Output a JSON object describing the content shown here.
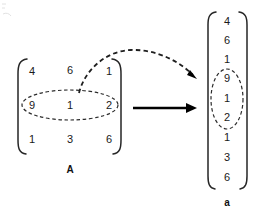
{
  "diagram": {
    "background_color": "#ffffff",
    "ink_color": "#1a1a1a",
    "matrix": {
      "label": "A",
      "rows": [
        [
          "4",
          "6",
          "1"
        ],
        [
          "9",
          "1",
          "2"
        ],
        [
          "1",
          "3",
          "6"
        ]
      ],
      "highlight_row_index": 1,
      "highlight_shape": "dashed-ellipse"
    },
    "vector": {
      "label": "a",
      "values": [
        "4",
        "6",
        "1",
        "9",
        "1",
        "2",
        "1",
        "3",
        "6"
      ],
      "highlight_start_index": 3,
      "highlight_end_index": 5,
      "highlight_shape": "dashed-ellipse"
    },
    "connectors": {
      "main_arrow": {
        "style": "solid",
        "direction": "right",
        "name": "transform-arrow"
      },
      "trace_arrow": {
        "style": "dashed",
        "direction": "curved-right",
        "name": "row-mapping-arrow"
      }
    }
  }
}
